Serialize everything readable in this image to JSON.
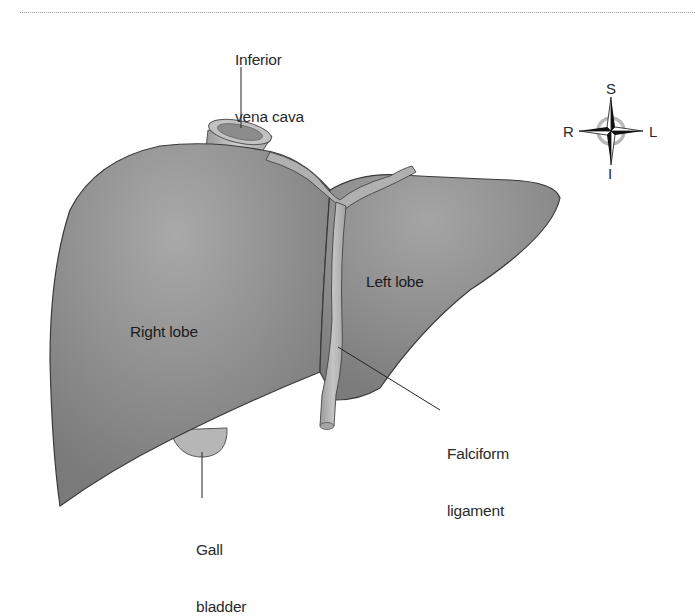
{
  "figure": {
    "colors": {
      "liver_fill": "#8a8a8a",
      "liver_highlight": "#a8a8a8",
      "liver_outline": "#3a3a3a",
      "ligament_fill": "#b4b4b4",
      "gallbladder_fill": "#b8b8b8",
      "label_text": "#2a2a2a",
      "rule": "#9a9a9a"
    },
    "labels": {
      "ivc_line1": "Inferior",
      "ivc_line2": "vena cava",
      "right_lobe": "Right lobe",
      "left_lobe": "Left lobe",
      "falciform_line1": "Falciform",
      "falciform_line2": "ligament",
      "gall_line1": "Gall",
      "gall_line2": "bladder"
    },
    "compass": {
      "top": "S",
      "bottom": "I",
      "left": "R",
      "right": "L",
      "icon": "compass-rose-icon"
    }
  }
}
